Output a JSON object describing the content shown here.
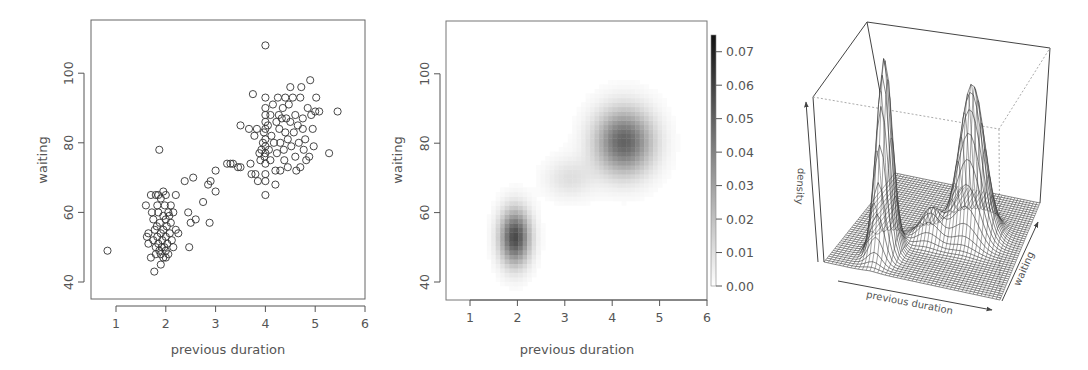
{
  "chart_data": [
    {
      "type": "scatter",
      "panel": "left",
      "title": "",
      "xlabel": "previous duration",
      "ylabel": "waiting",
      "xlim": [
        0.5,
        6
      ],
      "ylim": [
        35,
        115
      ],
      "xticks": [
        1,
        2,
        3,
        4,
        5,
        6
      ],
      "yticks": [
        40,
        60,
        80,
        100
      ],
      "marker": "open-circle",
      "grid": false,
      "points": [
        [
          0.83,
          49
        ],
        [
          1.87,
          78
        ],
        [
          1.6,
          62
        ],
        [
          1.7,
          65
        ],
        [
          1.8,
          65
        ],
        [
          1.85,
          65
        ],
        [
          1.9,
          64
        ],
        [
          1.95,
          66
        ],
        [
          2.0,
          65
        ],
        [
          2.1,
          62
        ],
        [
          2.2,
          65
        ],
        [
          1.65,
          54
        ],
        [
          1.62,
          53
        ],
        [
          1.65,
          51
        ],
        [
          1.7,
          47
        ],
        [
          1.75,
          58
        ],
        [
          1.75,
          52
        ],
        [
          1.78,
          55
        ],
        [
          1.8,
          50
        ],
        [
          1.8,
          48
        ],
        [
          1.82,
          56
        ],
        [
          1.83,
          53
        ],
        [
          1.85,
          60
        ],
        [
          1.85,
          51
        ],
        [
          1.87,
          49
        ],
        [
          1.88,
          57
        ],
        [
          1.9,
          54
        ],
        [
          1.9,
          48
        ],
        [
          1.92,
          50
        ],
        [
          1.93,
          52
        ],
        [
          1.95,
          59
        ],
        [
          1.95,
          55
        ],
        [
          1.97,
          50
        ],
        [
          1.98,
          62
        ],
        [
          2.0,
          58
        ],
        [
          2.0,
          53
        ],
        [
          2.0,
          49
        ],
        [
          2.02,
          56
        ],
        [
          2.03,
          51
        ],
        [
          2.05,
          60
        ],
        [
          2.05,
          48
        ],
        [
          2.08,
          54
        ],
        [
          2.1,
          57
        ],
        [
          2.12,
          52
        ],
        [
          2.15,
          60
        ],
        [
          2.15,
          50
        ],
        [
          2.2,
          55
        ],
        [
          2.25,
          54
        ],
        [
          1.77,
          43
        ],
        [
          1.9,
          45
        ],
        [
          1.95,
          47
        ],
        [
          2.0,
          47
        ],
        [
          1.72,
          60
        ],
        [
          1.83,
          62
        ],
        [
          2.07,
          59
        ],
        [
          2.38,
          69
        ],
        [
          2.55,
          70
        ],
        [
          2.45,
          60
        ],
        [
          2.5,
          57
        ],
        [
          2.6,
          58
        ],
        [
          2.75,
          63
        ],
        [
          2.85,
          68
        ],
        [
          2.9,
          69
        ],
        [
          3.0,
          72
        ],
        [
          3.0,
          66
        ],
        [
          2.88,
          57
        ],
        [
          2.47,
          50
        ],
        [
          3.23,
          74
        ],
        [
          3.3,
          74
        ],
        [
          3.35,
          74
        ],
        [
          3.45,
          73
        ],
        [
          3.5,
          73
        ],
        [
          3.5,
          85
        ],
        [
          3.67,
          84
        ],
        [
          3.7,
          74
        ],
        [
          3.72,
          71
        ],
        [
          3.75,
          94
        ],
        [
          3.78,
          82
        ],
        [
          3.8,
          71
        ],
        [
          3.83,
          84
        ],
        [
          3.85,
          69
        ],
        [
          3.88,
          77
        ],
        [
          3.9,
          75
        ],
        [
          3.92,
          78
        ],
        [
          3.95,
          80
        ],
        [
          3.97,
          83
        ],
        [
          3.98,
          76
        ],
        [
          4.0,
          93
        ],
        [
          4.0,
          90
        ],
        [
          4.0,
          88
        ],
        [
          4.0,
          86
        ],
        [
          4.0,
          84
        ],
        [
          4.0,
          81
        ],
        [
          4.0,
          79
        ],
        [
          4.0,
          77
        ],
        [
          4.0,
          74
        ],
        [
          4.0,
          71
        ],
        [
          4.0,
          69
        ],
        [
          4.0,
          65
        ],
        [
          4.0,
          108
        ],
        [
          4.05,
          85
        ],
        [
          4.07,
          78
        ],
        [
          4.1,
          88
        ],
        [
          4.1,
          75
        ],
        [
          4.12,
          82
        ],
        [
          4.15,
          91
        ],
        [
          4.17,
          80
        ],
        [
          4.2,
          72
        ],
        [
          4.2,
          68
        ],
        [
          4.22,
          86
        ],
        [
          4.23,
          77
        ],
        [
          4.25,
          93
        ],
        [
          4.27,
          88
        ],
        [
          4.28,
          84
        ],
        [
          4.3,
          80
        ],
        [
          4.3,
          72
        ],
        [
          4.33,
          87
        ],
        [
          4.35,
          90
        ],
        [
          4.37,
          78
        ],
        [
          4.38,
          75
        ],
        [
          4.4,
          93
        ],
        [
          4.4,
          83
        ],
        [
          4.42,
          87
        ],
        [
          4.45,
          81
        ],
        [
          4.45,
          73
        ],
        [
          4.47,
          91
        ],
        [
          4.5,
          96
        ],
        [
          4.5,
          86
        ],
        [
          4.52,
          79
        ],
        [
          4.55,
          93
        ],
        [
          4.57,
          83
        ],
        [
          4.6,
          88
        ],
        [
          4.6,
          76
        ],
        [
          4.62,
          72
        ],
        [
          4.65,
          85
        ],
        [
          4.67,
          80
        ],
        [
          4.7,
          93
        ],
        [
          4.7,
          73
        ],
        [
          4.72,
          96
        ],
        [
          4.75,
          87
        ],
        [
          4.75,
          84
        ],
        [
          4.77,
          78
        ],
        [
          4.8,
          81
        ],
        [
          4.82,
          75
        ],
        [
          4.85,
          90
        ],
        [
          4.88,
          76
        ],
        [
          4.9,
          98
        ],
        [
          4.92,
          88
        ],
        [
          4.95,
          84
        ],
        [
          4.97,
          79
        ],
        [
          5.0,
          89
        ],
        [
          5.02,
          93
        ],
        [
          5.08,
          89
        ],
        [
          5.28,
          77
        ],
        [
          5.45,
          89
        ]
      ]
    },
    {
      "type": "heatmap",
      "panel": "middle",
      "title": "",
      "xlabel": "previous duration",
      "ylabel": "waiting",
      "xlim": [
        0.5,
        6
      ],
      "ylim": [
        35,
        115
      ],
      "xticks": [
        1,
        2,
        3,
        4,
        5,
        6
      ],
      "yticks": [
        40,
        60,
        80,
        100
      ],
      "colorscale": "white-to-black (grayscale)",
      "colorbar": {
        "range": [
          0.0,
          0.075
        ],
        "ticks": [
          0.0,
          0.01,
          0.02,
          0.03,
          0.04,
          0.05,
          0.06,
          0.07
        ],
        "tick_labels": [
          "0.00",
          "0.01",
          "0.02",
          "0.03",
          "0.04",
          "0.05",
          "0.06",
          "0.07"
        ]
      },
      "density_components": [
        {
          "mx": 1.95,
          "my": 53,
          "sx": 0.22,
          "sy": 5.5,
          "weight": 0.058
        },
        {
          "mx": 4.25,
          "my": 80.5,
          "sx": 0.42,
          "sy": 6.5,
          "weight": 0.05
        },
        {
          "mx": 3.1,
          "my": 70,
          "sx": 0.35,
          "sy": 4.0,
          "weight": 0.01
        }
      ],
      "peaks": [
        {
          "x": 1.95,
          "y": 53,
          "density_approx": 0.06
        },
        {
          "x": 4.1,
          "y": 79,
          "density_approx": 0.05
        }
      ]
    },
    {
      "type": "surface3d",
      "panel": "right",
      "title": "",
      "xlabel": "previous duration",
      "ylabel": "waiting",
      "zlabel": "density",
      "style": "wireframe perspective mesh",
      "peaks": [
        {
          "label": "left (short duration) peak",
          "height_rel": 0.72
        },
        {
          "label": "right (long duration) peak",
          "height_rel": 1.0
        }
      ]
    }
  ],
  "panels": {
    "scatter": {
      "xlabel": "previous duration",
      "ylabel": "waiting",
      "xtick_labels": [
        "1",
        "2",
        "3",
        "4",
        "5",
        "6"
      ],
      "ytick_labels": [
        "40",
        "60",
        "80",
        "100"
      ]
    },
    "heatmap": {
      "xlabel": "previous duration",
      "ylabel": "waiting",
      "xtick_labels": [
        "1",
        "2",
        "3",
        "4",
        "5",
        "6"
      ],
      "ytick_labels": [
        "40",
        "60",
        "80",
        "100"
      ],
      "colorbar_labels": [
        "0.00",
        "0.01",
        "0.02",
        "0.03",
        "0.04",
        "0.05",
        "0.06",
        "0.07"
      ]
    },
    "surface": {
      "xlabel": "previous duration",
      "ylabel": "waiting",
      "zlabel": "density"
    }
  },
  "colors": {
    "ink": "#333333",
    "axis": "#555555",
    "box": "#666666",
    "background": "#ffffff"
  }
}
